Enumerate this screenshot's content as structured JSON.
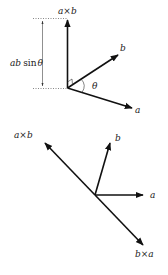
{
  "figure": {
    "top": {
      "labels": {
        "cross_ab": "a×b",
        "magnitude_prefix": "ab",
        "magnitude_sin": "sin",
        "magnitude_theta": "θ",
        "vec_b": "b",
        "vec_a": "a",
        "angle": "θ"
      }
    },
    "bottom": {
      "labels": {
        "cross_ab": "a×b",
        "cross_ba": "b×a",
        "vec_b": "b",
        "vec_a": "a"
      }
    },
    "colors": {
      "ink": "#111111",
      "guide": "#555555"
    }
  }
}
